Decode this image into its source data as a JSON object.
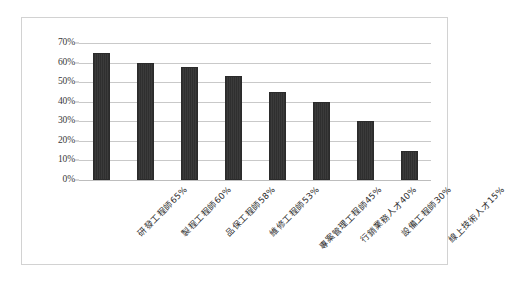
{
  "chart_data": {
    "type": "bar",
    "title": "",
    "subtitle": "",
    "xlabel": "",
    "ylabel": "",
    "ylim": [
      0,
      0.7
    ],
    "grid": true,
    "legend": false,
    "orientation": "vertical",
    "categories": [
      "研發工程師65%",
      "製程工程師60%",
      "品保工程師58%",
      "維修工程師53%",
      "專案管理工程師45%",
      "行銷業務人才40%",
      "設備工程師30%",
      "線上技術人才15%"
    ],
    "values": [
      0.65,
      0.6,
      0.58,
      0.53,
      0.45,
      0.4,
      0.3,
      0.15
    ],
    "value_labels": [
      "65%",
      "60%",
      "58%",
      "53%",
      "45%",
      "40%",
      "30%",
      "15%"
    ],
    "y_ticks": [
      0.7,
      0.6,
      0.5,
      0.4,
      0.3,
      0.2,
      0.1,
      0.0
    ],
    "y_tick_labels": [
      "70%",
      "60%",
      "50%",
      "40%",
      "30%",
      "20%",
      "10%",
      "0%"
    ],
    "series": [
      {
        "name": "需求比例",
        "values": [
          0.65,
          0.6,
          0.58,
          0.53,
          0.45,
          0.4,
          0.3,
          0.15
        ]
      }
    ]
  },
  "style": {
    "bar_color": "#343434",
    "bar_edge_color": "#2b2b2b",
    "gridline_color": "#c9c9c9",
    "frame_border_color": "#d2d2d2",
    "background_color": "#ffffff",
    "tick_label_color": "#3a3a3a"
  }
}
